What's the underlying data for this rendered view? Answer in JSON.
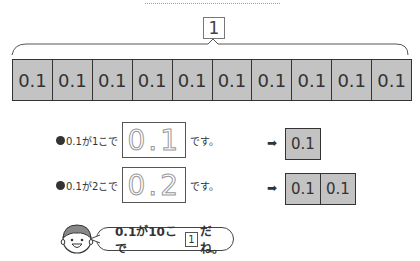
{
  "whole_label": "1",
  "bar": {
    "cells": [
      "0.1",
      "0.1",
      "0.1",
      "0.1",
      "0.1",
      "0.1",
      "0.1",
      "0.1",
      "0.1",
      "0.1"
    ]
  },
  "rows": [
    {
      "prefix": "0.1が1こで",
      "traced_value": "0.1",
      "suffix": "です。",
      "result_cells": [
        "0.1"
      ]
    },
    {
      "prefix": "0.1が2こで",
      "traced_value": "0.2",
      "suffix": "です。",
      "result_cells": [
        "0.1",
        "0.1"
      ]
    }
  ],
  "arrow_glyph": "➡",
  "speech": {
    "before": "0.1が10こで",
    "boxed": "1",
    "after": "だね。"
  },
  "colors": {
    "cell_fill": "#c3c3c3",
    "line": "#333333"
  }
}
